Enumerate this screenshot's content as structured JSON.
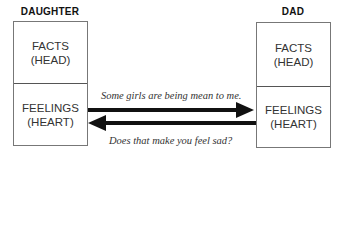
{
  "daughter": {
    "title": "DAUGHTER",
    "top": {
      "line1": "FACTS",
      "line2": "(HEAD)"
    },
    "bottom": {
      "line1": "FEELINGS",
      "line2": "(HEART)"
    }
  },
  "dad": {
    "title": "DAD",
    "top": {
      "line1": "FACTS",
      "line2": "(HEAD)"
    },
    "bottom": {
      "line1": "FEELINGS",
      "line2": "(HEART)"
    }
  },
  "arrows": {
    "to_dad": {
      "label": "Some girls are being mean to me.",
      "from": "daughter.feelings",
      "to": "dad.feelings"
    },
    "to_daughter": {
      "label": "Does that make you feel sad?",
      "from": "dad.feelings",
      "to": "daughter.feelings"
    }
  },
  "colors": {
    "arrow": "#111111",
    "border": "#777777",
    "text": "#333333"
  }
}
